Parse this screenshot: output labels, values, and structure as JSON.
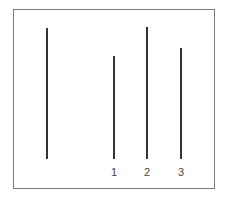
{
  "diagram": {
    "reference_line": {
      "label": "",
      "x": 47,
      "top": 28,
      "bottom": 159
    },
    "comparison_lines": [
      {
        "label": "1",
        "x": 114,
        "top": 56,
        "bottom": 159
      },
      {
        "label": "2",
        "x": 147,
        "top": 27,
        "bottom": 159
      },
      {
        "label": "3",
        "x": 181,
        "top": 48,
        "bottom": 159
      }
    ],
    "colors": {
      "line": "#333333",
      "border": "#7a7a80",
      "label": "#444444"
    }
  }
}
